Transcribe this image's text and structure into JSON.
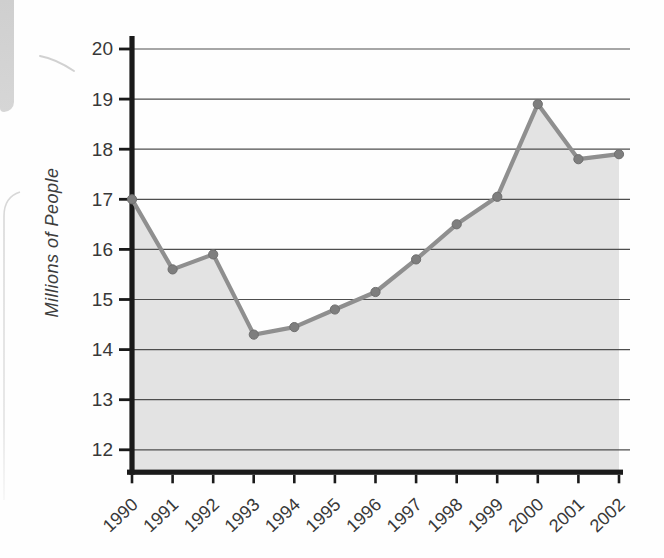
{
  "chart_data": {
    "type": "area",
    "title": "",
    "xlabel": "",
    "ylabel": "Millions of People",
    "categories": [
      "1990",
      "1991",
      "1992",
      "1993",
      "1994",
      "1995",
      "1996",
      "1997",
      "1998",
      "1999",
      "2000",
      "2001",
      "2002"
    ],
    "values": [
      17.0,
      15.6,
      15.9,
      14.3,
      14.45,
      14.8,
      15.15,
      15.8,
      16.5,
      17.05,
      18.9,
      17.8,
      17.9
    ],
    "ylim": [
      12,
      20
    ],
    "yticks": [
      20,
      19,
      18,
      17,
      16,
      15,
      14,
      13,
      12
    ],
    "grid": true,
    "legend": false,
    "colors": {
      "line": "#8f8f8f",
      "marker_fill": "#7e7e7e",
      "marker_stroke": "#6f6f6f",
      "area_fill": "#e3e3e3",
      "gridline": "#4e4e4e",
      "axis": "#1a1a1a",
      "tick_label": "#383838"
    }
  }
}
